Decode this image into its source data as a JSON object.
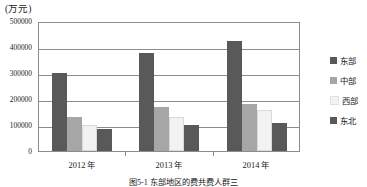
{
  "chart_data": {
    "type": "bar",
    "title": "",
    "unit_label": "(万元)",
    "xlabel": "",
    "ylabel": "",
    "categories": [
      "2012 年",
      "2013 年",
      "2014 年"
    ],
    "series": [
      {
        "name": "东部",
        "color": "#595959",
        "values": [
          300000,
          375000,
          422000
        ]
      },
      {
        "name": "中部",
        "color": "#a6a6a6",
        "values": [
          132000,
          168000,
          182000
        ]
      },
      {
        "name": "西部",
        "color": "#f2f2f2",
        "values": [
          100000,
          131000,
          156000
        ]
      },
      {
        "name": "东北",
        "color": "#595959",
        "values": [
          83000,
          99000,
          106000
        ]
      }
    ],
    "ylim": [
      0,
      500000
    ],
    "yticks": [
      "500000",
      "400000",
      "300000",
      "200000",
      "100000",
      "0"
    ],
    "ytick_values": [
      500000,
      400000,
      300000,
      200000,
      100000,
      0
    ],
    "grid": true,
    "legend_position": "right"
  },
  "caption": {
    "text": "图5-1   东部地区的费共费人群三"
  }
}
